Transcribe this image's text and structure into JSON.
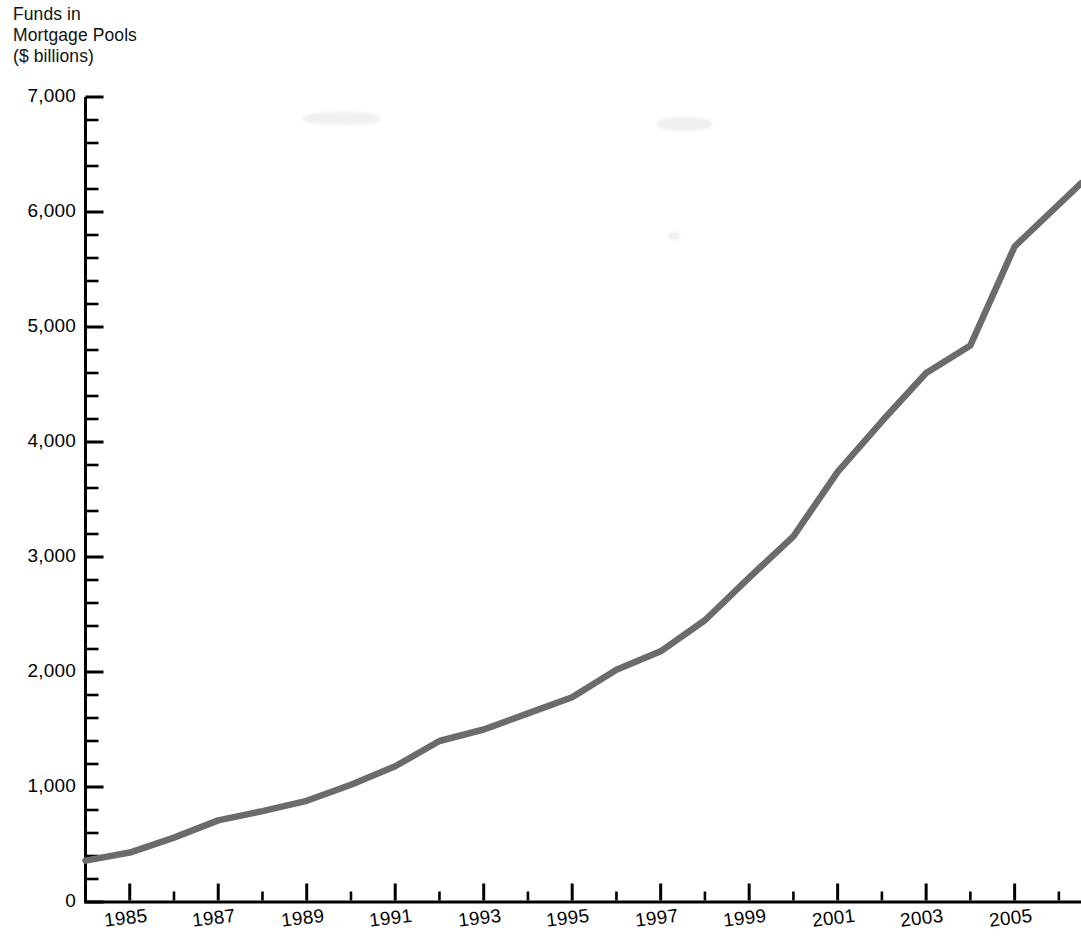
{
  "figure": {
    "title_lines": [
      "Funds in",
      "Mortgage Pools",
      "($ billions)"
    ],
    "line_color": "#6b6b6b",
    "axis_color": "#000000",
    "background": "#ffffff"
  },
  "chart_data": {
    "type": "line",
    "title": "Funds in Mortgage Pools ($ billions)",
    "xlabel": "",
    "ylabel": "Funds in Mortgage Pools ($ billions)",
    "ylim": [
      0,
      7000
    ],
    "xlim": [
      1984,
      2006.5
    ],
    "grid": false,
    "legend": null,
    "y_major_tick_interval": 1000,
    "y_minor_tick_interval": 200,
    "x_major_tick_interval": 2,
    "x_minor_tick_interval": 1,
    "ytick_labels": [
      "0",
      "1,000",
      "2,000",
      "3,000",
      "4,000",
      "5,000",
      "6,000",
      "7,000"
    ],
    "ytick_values": [
      0,
      1000,
      2000,
      3000,
      4000,
      5000,
      6000,
      7000
    ],
    "xtick_labels": [
      "1985",
      "1987",
      "1989",
      "1991",
      "1993",
      "1995",
      "1997",
      "1999",
      "2001",
      "2003",
      "2005"
    ],
    "xtick_values": [
      1985,
      1987,
      1989,
      1991,
      1993,
      1995,
      1997,
      1999,
      2001,
      2003,
      2005
    ],
    "x": [
      1984,
      1985,
      1986,
      1987,
      1988,
      1989,
      1990,
      1991,
      1992,
      1993,
      1994,
      1995,
      1996,
      1997,
      1998,
      1999,
      2000,
      2001,
      2002,
      2003,
      2004,
      2005,
      2006.5
    ],
    "values": [
      360,
      430,
      560,
      710,
      790,
      880,
      1020,
      1180,
      1400,
      1500,
      1640,
      1780,
      2020,
      2180,
      2450,
      2820,
      3180,
      3740,
      4180,
      4600,
      4840,
      5700,
      6250
    ],
    "series": [
      {
        "name": "Funds in Mortgage Pools",
        "values": [
          360,
          430,
          560,
          710,
          790,
          880,
          1020,
          1180,
          1400,
          1500,
          1640,
          1780,
          2020,
          2180,
          2450,
          2820,
          3180,
          3740,
          4180,
          4600,
          4840,
          5700,
          6250
        ]
      }
    ]
  }
}
